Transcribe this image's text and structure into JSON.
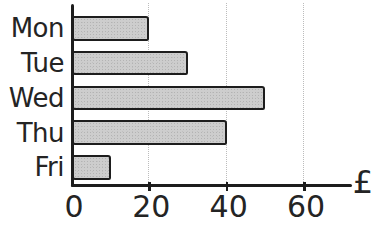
{
  "chart_data": {
    "type": "bar",
    "orientation": "horizontal",
    "categories": [
      "Mon",
      "Tue",
      "Wed",
      "Thu",
      "Fri"
    ],
    "values": [
      20,
      30,
      50,
      40,
      10
    ],
    "title": "",
    "xlabel": "£",
    "ylabel": "",
    "xlim": [
      0,
      72
    ],
    "xticks": [
      0,
      20,
      40,
      60
    ],
    "grid": true,
    "legend": false
  },
  "style": {
    "background": "#ffffff",
    "bar_fill": "#cdcdcd",
    "bar_border": "#1d1d1d",
    "axis_color": "#1d1d1d",
    "gridline_color": "#bcbcbc",
    "text_color": "#242424"
  }
}
